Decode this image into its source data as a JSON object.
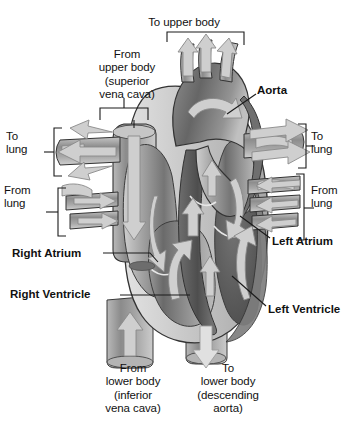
{
  "figure": {
    "background": "#ffffff",
    "colors": {
      "outline": "#2b2b2b",
      "muscle_dark": "#5c5c5c",
      "muscle_mid": "#8f8f8f",
      "muscle_light": "#c9c9c9",
      "vessel_light": "#d9d9d9",
      "arrow_fill": "#cfcfcf",
      "arrow_stroke": "#7a7a7a",
      "leader_line": "#1a1a1a",
      "bracket": "#1a1a1a",
      "text": "#111111"
    }
  },
  "labels": {
    "to_upper_body": "To upper body",
    "from_upper_body": "From\nupper body\n(superior\nvena cava)",
    "aorta": "Aorta",
    "to_lung_left": "To\nlung",
    "from_lung_left": "From\nlung",
    "to_lung_right": "To\nlung",
    "from_lung_right": "From\nlung",
    "left_atrium": "Left Atrium",
    "right_atrium": "Right Atrium",
    "left_ventricle": "Left Ventricle",
    "right_ventricle": "Right Ventricle",
    "from_lower_body": "From\nlower body\n(inferior\nvena cava)",
    "to_lower_body": "To\nlower body\n(descending\naorta)"
  },
  "anatomy": {
    "chambers": [
      "Right Atrium",
      "Right Ventricle",
      "Left Atrium",
      "Left Ventricle"
    ],
    "vessels": [
      "Aorta",
      "Superior vena cava",
      "Inferior vena cava",
      "Descending aorta",
      "Pulmonary artery (to lung)",
      "Pulmonary vein (from lung)"
    ],
    "flow_arrows": [
      {
        "name": "to-upper-body-branch-1",
        "direction": "up"
      },
      {
        "name": "to-upper-body-branch-2",
        "direction": "up"
      },
      {
        "name": "to-upper-body-branch-3",
        "direction": "up"
      },
      {
        "name": "superior-vena-cava-inflow",
        "direction": "down"
      },
      {
        "name": "inferior-vena-cava-inflow",
        "direction": "up"
      },
      {
        "name": "descending-aorta-outflow",
        "direction": "down"
      },
      {
        "name": "to-lung-left-upper",
        "direction": "left"
      },
      {
        "name": "to-lung-left-mid",
        "direction": "left"
      },
      {
        "name": "to-lung-left-lower",
        "direction": "left"
      },
      {
        "name": "from-lung-left-upper",
        "direction": "right"
      },
      {
        "name": "from-lung-left-lower",
        "direction": "right"
      },
      {
        "name": "to-lung-right-upper",
        "direction": "right"
      },
      {
        "name": "to-lung-right-lower",
        "direction": "right"
      },
      {
        "name": "from-lung-right-upper",
        "direction": "left"
      },
      {
        "name": "from-lung-right-lower",
        "direction": "left"
      },
      {
        "name": "aortic-arch-flow",
        "direction": "curve-right"
      },
      {
        "name": "right-ventricle-flow",
        "direction": "curve-up"
      },
      {
        "name": "left-ventricle-flow",
        "direction": "curve-up"
      }
    ]
  }
}
